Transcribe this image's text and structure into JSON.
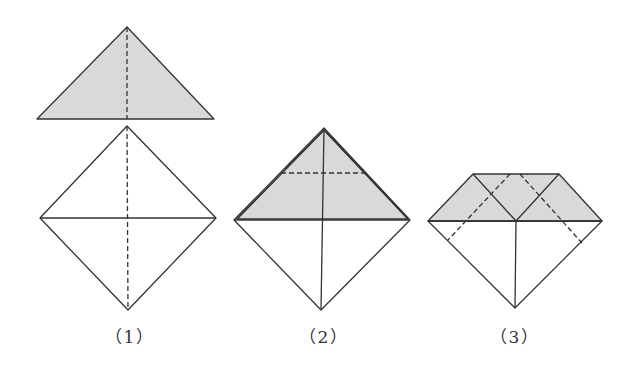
{
  "diagram": {
    "type": "origami-fold-steps",
    "colors": {
      "stroke": "#333333",
      "fill": "#d9d9d9",
      "background": "#ffffff"
    },
    "steps": [
      {
        "id": 1,
        "label": "（1）",
        "label_x": 130
      },
      {
        "id": 2,
        "label": "（2）",
        "label_x": 324
      },
      {
        "id": 3,
        "label": "（3）",
        "label_x": 515
      }
    ]
  }
}
